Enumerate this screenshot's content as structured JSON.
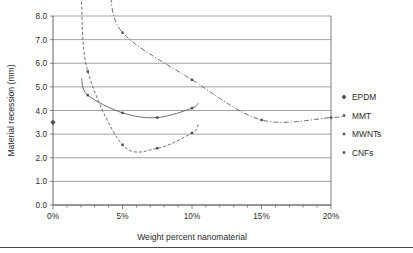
{
  "chart_data": {
    "type": "line",
    "title": "",
    "xlabel": "Weight percent nanomaterial",
    "ylabel": "Material recession (mm)",
    "xlim": [
      0,
      20
    ],
    "ylim": [
      0,
      8
    ],
    "xtick_labels": [
      "0%",
      "5%",
      "10%",
      "15%",
      "20%"
    ],
    "xtick_values": [
      0,
      5,
      10,
      15,
      20
    ],
    "xtick_minor_step": 1,
    "ytick_labels": [
      "0.0",
      "1.0",
      "2.0",
      "3.0",
      "4.0",
      "5.0",
      "6.0",
      "7.0",
      "8.0"
    ],
    "ytick_values": [
      0,
      1,
      2,
      3,
      4,
      5,
      6,
      7,
      8
    ],
    "grid": "horizontal",
    "legend_position": "right",
    "series": [
      {
        "name": "EPDM",
        "marker": "diamond",
        "line": "none",
        "color": "#4a4a4a",
        "points": [
          {
            "x": 0,
            "y": 3.5
          }
        ]
      },
      {
        "name": "MMT",
        "marker": "square",
        "line": "solid",
        "color": "#555555",
        "points": [
          {
            "x": 2.5,
            "y": 4.65
          },
          {
            "x": 5,
            "y": 3.9
          },
          {
            "x": 7.5,
            "y": 3.7
          },
          {
            "x": 10,
            "y": 4.1
          }
        ]
      },
      {
        "name": "MWNTs",
        "marker": "square",
        "line": "dashed",
        "color": "#666666",
        "points": [
          {
            "x": 2.5,
            "y": 5.65
          },
          {
            "x": 5,
            "y": 2.55
          },
          {
            "x": 7.5,
            "y": 2.4
          },
          {
            "x": 10,
            "y": 3.05
          }
        ]
      },
      {
        "name": "CNFs",
        "marker": "square",
        "line": "dash-dot",
        "color": "#6a6a6a",
        "points": [
          {
            "x": 5,
            "y": 7.3
          },
          {
            "x": 10,
            "y": 5.3
          },
          {
            "x": 15,
            "y": 3.6
          },
          {
            "x": 20,
            "y": 3.7
          }
        ]
      }
    ]
  },
  "legend": {
    "items": [
      {
        "label": "EPDM",
        "marker": "diamond-marker-icon"
      },
      {
        "label": "MMT",
        "marker": "square-marker-icon"
      },
      {
        "label": "MWNTs",
        "marker": "square-marker-icon"
      },
      {
        "label": "CNFs",
        "marker": "square-marker-icon"
      }
    ]
  },
  "colors": {
    "grid": "#7a7a7a",
    "axis": "#555555",
    "marker": "#4a4a4a",
    "background": "#ffffff",
    "text": "#2b2b2b"
  }
}
